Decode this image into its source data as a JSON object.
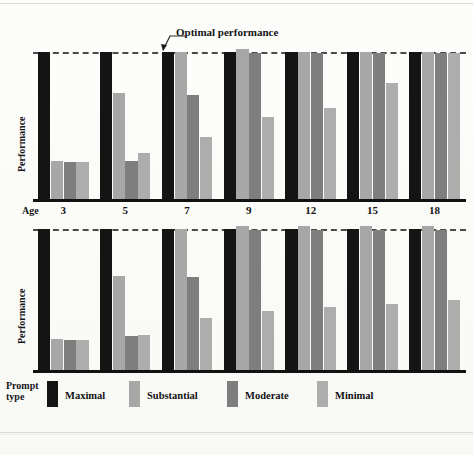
{
  "figure": {
    "annotation": "Optimal performance",
    "y_axis_label": "Performance",
    "age_caption": "Age",
    "legend_caption_line1": "Prompt",
    "legend_caption_line2": "type"
  },
  "colors": {
    "maximal": "#141414",
    "substantial": "#a7a7a7",
    "moderate": "#7e7e7e",
    "minimal": "#adadad",
    "optimal_line": "#4a4a4a",
    "baseline": "#111111",
    "page": "#fbfbf8"
  },
  "legend": {
    "items": [
      {
        "label": "Maximal",
        "key": "maximal"
      },
      {
        "label": "Substantial",
        "key": "substantial"
      },
      {
        "label": "Moderate",
        "key": "moderate"
      },
      {
        "label": "Minimal",
        "key": "minimal"
      }
    ]
  },
  "chart_data": {
    "type": "bar",
    "title": "",
    "xlabel": "Age",
    "ylabel": "Performance",
    "ylim": [
      0,
      100
    ],
    "grid": false,
    "legend_position": "bottom",
    "annotations": [
      {
        "text": "Optimal performance",
        "value": 100,
        "style": "dashed reference line"
      }
    ],
    "categories": [
      "3",
      "5",
      "7",
      "9",
      "12",
      "15",
      "18"
    ],
    "panels": [
      {
        "name": "top-panel",
        "series": [
          {
            "name": "Maximal",
            "values": [
              100,
              100,
              100,
              100,
              100,
              100,
              100
            ]
          },
          {
            "name": "Substantial",
            "values": [
              26,
              72,
              100,
              102,
              100,
              100,
              100
            ]
          },
          {
            "name": "Moderate",
            "values": [
              25,
              26,
              71,
              99,
              99,
              99,
              99
            ]
          },
          {
            "name": "Minimal",
            "values": [
              25,
              31,
              42,
              56,
              62,
              79,
              99
            ]
          }
        ]
      },
      {
        "name": "bottom-panel",
        "series": [
          {
            "name": "Maximal",
            "values": [
              100,
              100,
              100,
              100,
              100,
              100,
              100
            ]
          },
          {
            "name": "Substantial",
            "values": [
              22,
              67,
              100,
              102,
              102,
              102,
              102
            ]
          },
          {
            "name": "Moderate",
            "values": [
              21,
              24,
              66,
              99,
              99,
              99,
              99
            ]
          },
          {
            "name": "Minimal",
            "values": [
              21,
              25,
              37,
              42,
              45,
              47,
              50
            ]
          }
        ]
      }
    ]
  }
}
